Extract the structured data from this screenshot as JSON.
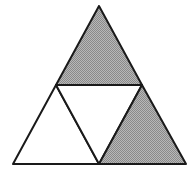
{
  "diagram": {
    "type": "subdivided-triangle",
    "colors": {
      "shaded": "#a3a3a3",
      "unshaded": "#ffffff",
      "stroke": "#1a1a1a"
    },
    "vertices": {
      "apex": [
        99,
        6
      ],
      "bottom_left": [
        13,
        164
      ],
      "bottom_right": [
        186,
        164
      ],
      "mid_left": [
        56,
        85
      ],
      "mid_right": [
        142,
        85
      ],
      "mid_bottom": [
        99,
        164
      ]
    },
    "regions": [
      {
        "name": "top",
        "shaded": true
      },
      {
        "name": "bottom-left",
        "shaded": false
      },
      {
        "name": "center-inverted",
        "shaded": false
      },
      {
        "name": "bottom-right",
        "shaded": true
      }
    ]
  }
}
